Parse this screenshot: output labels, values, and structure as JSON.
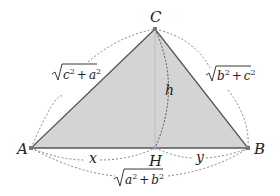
{
  "diagram": {
    "type": "geometry",
    "colors": {
      "triangle_fill": "#d4d4d4",
      "triangle_stroke": "#555555",
      "dashed_arc": "#666666",
      "altitude": "#bdbdbd",
      "text": "#222222"
    },
    "points": {
      "A": {
        "label": "A",
        "x": 31,
        "y": 148
      },
      "B": {
        "label": "B",
        "x": 248,
        "y": 148
      },
      "C": {
        "label": "C",
        "x": 155,
        "y": 29
      },
      "H": {
        "label": "H",
        "x": 155,
        "y": 148
      }
    },
    "segment_labels": {
      "AH": "x",
      "HB": "y",
      "CH": "h",
      "AC": {
        "radicand_1": "c",
        "radicand_2": "a",
        "exp": "2",
        "op": "+",
        "text": "√(c² + a²)"
      },
      "CB": {
        "radicand_1": "b",
        "radicand_2": "c",
        "exp": "2",
        "op": "+",
        "text": "√(b² + c²)"
      },
      "AB": {
        "radicand_1": "a",
        "radicand_2": "b",
        "exp": "2",
        "op": "+",
        "text": "√(a² + b²)"
      }
    }
  }
}
